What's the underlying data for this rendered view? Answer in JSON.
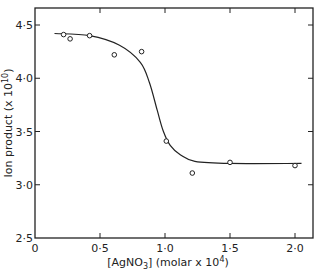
{
  "chart_data": {
    "type": "scatter",
    "title": "",
    "xlabel": "[AgNO₃] (molar x 10⁴)",
    "xlabel_parts": {
      "main": "[AgNO",
      "sub": "3",
      "mid": "] (molar x 10",
      "sup": "4",
      "end": ")"
    },
    "ylabel": "Ion product (x10¹⁰)",
    "ylabel_parts": {
      "main": "Ion product  (x 10",
      "sup": "10",
      "end": ")"
    },
    "xlim": [
      0,
      2.1
    ],
    "ylim": [
      2.5,
      4.6
    ],
    "xticks": [
      0,
      0.5,
      1.0,
      1.5,
      2.0
    ],
    "xtick_labels": [
      "0",
      "0·5",
      "1·0",
      "1·5",
      "2·0"
    ],
    "yticks": [
      2.5,
      3.0,
      3.5,
      4.0,
      4.5
    ],
    "ytick_labels": [
      "2·5",
      "3·0",
      "3·5",
      "4·0",
      "4·5"
    ],
    "grid": false,
    "legend": "none",
    "series": [
      {
        "name": "measured",
        "marker": "open-circle",
        "x": [
          0.22,
          0.27,
          0.42,
          0.61,
          0.82,
          1.01,
          1.21,
          1.5,
          2.0
        ],
        "y": [
          4.41,
          4.37,
          4.4,
          4.22,
          4.25,
          3.41,
          3.11,
          3.21,
          3.18
        ]
      },
      {
        "name": "fitted curve",
        "style": "smooth-line",
        "x": [
          0.15,
          0.42,
          0.65,
          0.81,
          0.88,
          0.94,
          0.985,
          1.04,
          1.12,
          1.23,
          1.5,
          2.05
        ],
        "y": [
          4.42,
          4.4,
          4.31,
          4.15,
          3.96,
          3.7,
          3.51,
          3.37,
          3.28,
          3.22,
          3.2,
          3.2
        ]
      }
    ]
  }
}
